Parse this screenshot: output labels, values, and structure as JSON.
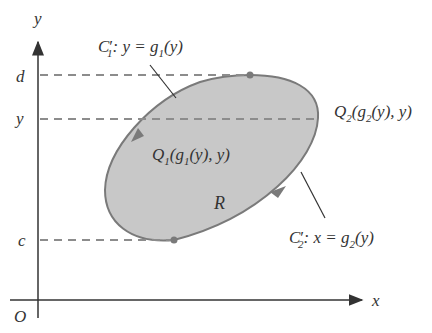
{
  "diagram": {
    "axes": {
      "x_label": "x",
      "y_label": "y",
      "origin_label": "O"
    },
    "y_ticks": [
      {
        "label": "d",
        "role": "max y of region"
      },
      {
        "label": "y",
        "role": "horizontal slice level"
      },
      {
        "label": "c",
        "role": "min y of region"
      }
    ],
    "region_label": "R",
    "curves": {
      "c1": {
        "name": "C",
        "sub": "1",
        "prime": "′",
        "eq_lhs": ": y = g",
        "eq_sub": "1",
        "eq_rhs": "(y)"
      },
      "c2": {
        "name": "C",
        "sub": "2",
        "prime": "′",
        "eq_lhs": ": x = g",
        "eq_sub": "2",
        "eq_rhs": "(y)"
      }
    },
    "points": {
      "q1": {
        "name": "Q",
        "sub": "1",
        "open": "(g",
        "gsub": "1",
        "close": "(y), y)"
      },
      "q2": {
        "name": "Q",
        "sub": "2",
        "open": "(g",
        "gsub": "2",
        "close": "(y), y)"
      }
    },
    "colors": {
      "region_fill": "#c8c8c8",
      "region_stroke": "#7a7a7a",
      "dashed": "#8c8c8c",
      "axis": "#333333"
    }
  }
}
